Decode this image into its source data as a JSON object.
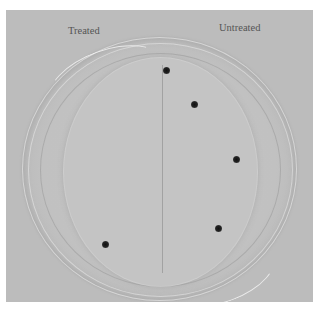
{
  "image": {
    "description": "Photograph of a petri dish divided by a center line, with small dark specks (insects/seeds) distributed mostly on the untreated side",
    "labels": {
      "left": "Treated",
      "right": "Untreated"
    },
    "dots": [
      {
        "x": 166,
        "y": 70
      },
      {
        "x": 194,
        "y": 104
      },
      {
        "x": 236,
        "y": 159
      },
      {
        "x": 218,
        "y": 228
      },
      {
        "x": 105,
        "y": 244
      }
    ],
    "colors": {
      "background": "#bcbcbc",
      "dish": "#c4c4c4",
      "dot": "#1a1a1a",
      "label": "#555555"
    }
  }
}
